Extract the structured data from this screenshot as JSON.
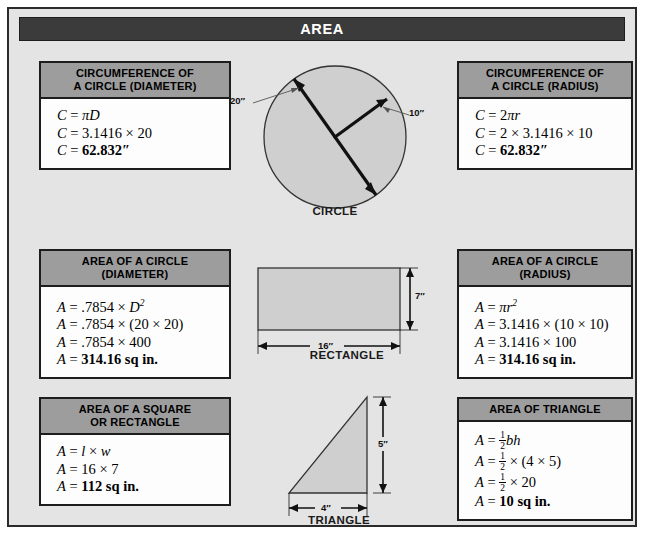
{
  "header": {
    "title": "AREA"
  },
  "boxes": {
    "circumference_diameter": {
      "title_line1": "CIRCUMFERENCE OF",
      "title_line2": "A CIRCLE (DIAMETER)",
      "lines": [
        {
          "lhs": "C",
          "rhs": "πD"
        },
        {
          "lhs": "C",
          "rhs": "3.1416 × 20"
        },
        {
          "lhs": "C",
          "rhs": "62.832″"
        }
      ]
    },
    "circumference_radius": {
      "title_line1": "CIRCUMFERENCE OF",
      "title_line2": "A CIRCLE (RADIUS)",
      "lines": [
        {
          "lhs": "C",
          "rhs": "2πr"
        },
        {
          "lhs": "C",
          "rhs": "2 × 3.1416 × 10"
        },
        {
          "lhs": "C",
          "rhs": "62.832″"
        }
      ]
    },
    "area_circle_diameter": {
      "title_line1": "AREA OF A CIRCLE",
      "title_line2": "(DIAMETER)",
      "lines": [
        {
          "lhs": "A",
          "rhs": ".7854 × D²"
        },
        {
          "lhs": "A",
          "rhs": ".7854 × (20 × 20)"
        },
        {
          "lhs": "A",
          "rhs": ".7854 × 400"
        },
        {
          "lhs": "A",
          "rhs": "314.16 sq in."
        }
      ]
    },
    "area_circle_radius": {
      "title_line1": "AREA OF A CIRCLE",
      "title_line2": "(RADIUS)",
      "lines": [
        {
          "lhs": "A",
          "rhs": "πr²"
        },
        {
          "lhs": "A",
          "rhs": "3.1416 × (10 × 10)"
        },
        {
          "lhs": "A",
          "rhs": "3.1416 × 100"
        },
        {
          "lhs": "A",
          "rhs": "314.16 sq in."
        }
      ]
    },
    "area_square_rectangle": {
      "title_line1": "AREA OF A SQUARE",
      "title_line2": "OR RECTANGLE",
      "lines": [
        {
          "lhs": "A",
          "rhs": "l × w"
        },
        {
          "lhs": "A",
          "rhs": "16 × 7"
        },
        {
          "lhs": "A",
          "rhs": "112 sq in."
        }
      ]
    },
    "area_triangle": {
      "title_line1": "AREA OF TRIANGLE",
      "title_line2": "",
      "lines": [
        {
          "lhs": "A",
          "rhs": "½bh"
        },
        {
          "lhs": "A",
          "rhs": "½ × (4 × 5)"
        },
        {
          "lhs": "A",
          "rhs": "½ × 20"
        },
        {
          "lhs": "A",
          "rhs": "10 sq in."
        }
      ]
    }
  },
  "diagrams": {
    "circle": {
      "caption": "CIRCLE",
      "diameter_label": "20″",
      "radius_label": "10″"
    },
    "rectangle": {
      "caption": "RECTANGLE",
      "width_label": "16″",
      "height_label": "7″"
    },
    "triangle": {
      "caption": "TRIANGLE",
      "base_label": "4″",
      "height_label": "5″"
    }
  },
  "colors": {
    "banner_bg": "#3b3b3b",
    "box_header_bg": "#9d9d9d",
    "page_bg": "#e4e4e4",
    "shape_fill": "#cfcfcf",
    "outline": "#1d1d1d"
  }
}
